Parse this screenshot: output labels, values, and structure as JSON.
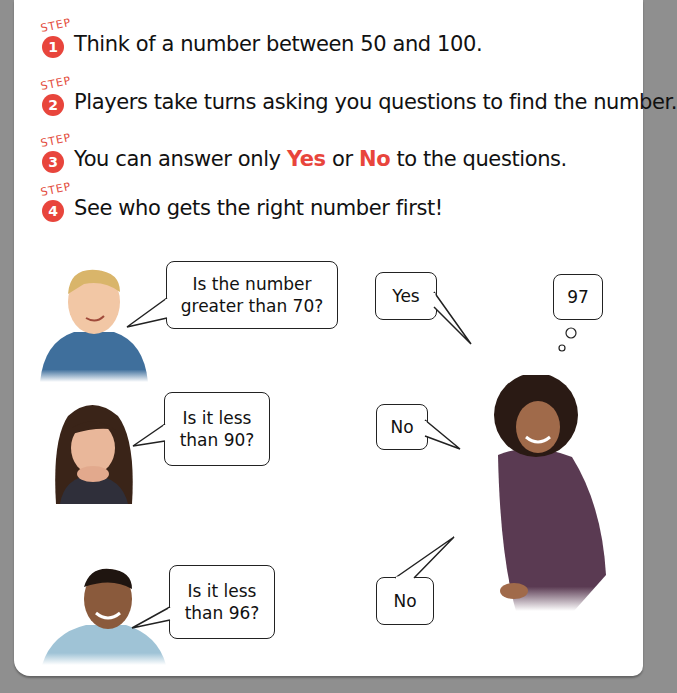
{
  "steps": [
    {
      "label": "STEP",
      "number": "1",
      "text": "Think of a number between 50 and 100."
    },
    {
      "label": "STEP",
      "number": "2",
      "text": "Players take turns asking you questions to find the number."
    },
    {
      "label": "STEP",
      "number": "3",
      "text_before": "You can answer only ",
      "yes": "Yes",
      "middle": " or ",
      "no": "No",
      "text_after": " to the questions."
    },
    {
      "label": "STEP",
      "number": "4",
      "text": "See who gets the right number first!"
    }
  ],
  "bubbles": {
    "q1": "Is the number greater than 70?",
    "q1_line1": "Is the number",
    "q1_line2": "greater than 70?",
    "a1": "Yes",
    "thought": "97",
    "q2_line1": "Is it less",
    "q2_line2": "than 90?",
    "a2": "No",
    "q3_line1": "Is it less",
    "q3_line2": "than 96?",
    "a3": "No"
  },
  "colors": {
    "accent": "#e8453c",
    "border": "#8f8f8f"
  }
}
